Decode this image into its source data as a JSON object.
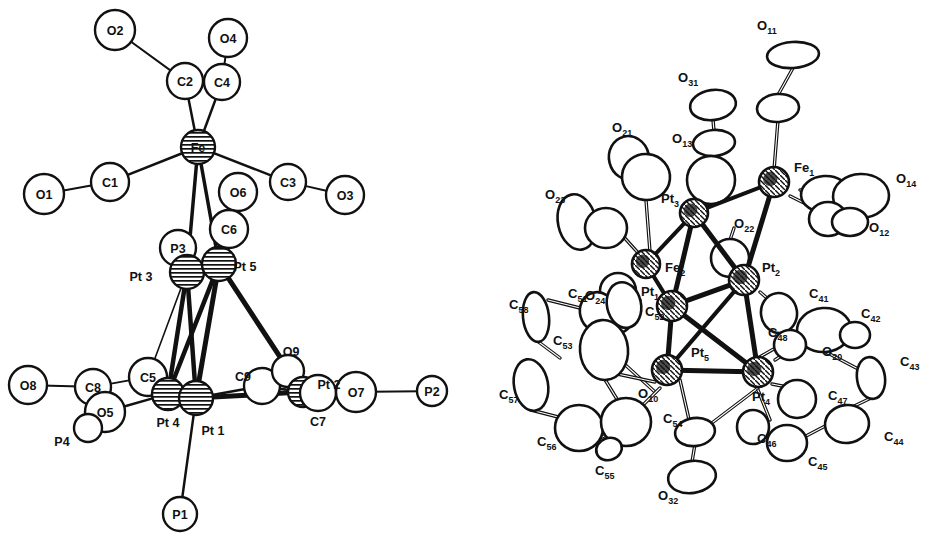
{
  "figure": {
    "kind": "crystal-structure-ortep-pair",
    "panels": [
      "left-core-skeleton",
      "right-full-thermal-ellipsoid"
    ]
  },
  "left": {
    "title": "",
    "style": "skeletal ball-and-stick, hatched metal atoms",
    "atoms": [
      {
        "id": "O2",
        "label": "O2",
        "x": 115,
        "y": 30,
        "r": 20,
        "kind": "circle",
        "fill": "white"
      },
      {
        "id": "O4",
        "label": "O4",
        "x": 228,
        "y": 38,
        "r": 19,
        "kind": "circle",
        "fill": "white"
      },
      {
        "id": "C2",
        "label": "C2",
        "x": 185,
        "y": 81,
        "r": 18,
        "kind": "circle",
        "fill": "white"
      },
      {
        "id": "C4",
        "label": "C4",
        "x": 222,
        "y": 82,
        "r": 18,
        "kind": "circle",
        "fill": "white"
      },
      {
        "id": "Fe",
        "label": "Fe",
        "x": 198,
        "y": 147,
        "r": 17,
        "kind": "hatched",
        "fill": "hatch"
      },
      {
        "id": "O1",
        "label": "O1",
        "x": 44,
        "y": 194,
        "r": 20,
        "kind": "circle",
        "fill": "white"
      },
      {
        "id": "C1",
        "label": "C1",
        "x": 110,
        "y": 182,
        "r": 19,
        "kind": "circle",
        "fill": "white"
      },
      {
        "id": "C3",
        "label": "C3",
        "x": 288,
        "y": 182,
        "r": 18,
        "kind": "circle",
        "fill": "white"
      },
      {
        "id": "O3",
        "label": "O3",
        "x": 345,
        "y": 195,
        "r": 19,
        "kind": "circle",
        "fill": "white"
      },
      {
        "id": "O6",
        "label": "O6",
        "x": 238,
        "y": 192,
        "r": 19,
        "kind": "circle",
        "fill": "white"
      },
      {
        "id": "C6",
        "label": "C6",
        "x": 229,
        "y": 229,
        "r": 19,
        "kind": "circle",
        "fill": "white"
      },
      {
        "id": "P3",
        "label": "P3",
        "x": 178,
        "y": 248,
        "r": 18,
        "kind": "circle",
        "fill": "white"
      },
      {
        "id": "Pt3",
        "label": "Pt 3",
        "x": 187,
        "y": 272,
        "r": 17,
        "kind": "hatched",
        "fill": "hatch",
        "label_dx": -46,
        "label_dy": 4
      },
      {
        "id": "Pt5",
        "label": "Pt 5",
        "x": 219,
        "y": 264,
        "r": 17,
        "kind": "hatched",
        "fill": "hatch",
        "label_dx": 26,
        "label_dy": 2
      },
      {
        "id": "C5",
        "label": "C5",
        "x": 148,
        "y": 377,
        "r": 19,
        "kind": "circle",
        "fill": "white"
      },
      {
        "id": "C8",
        "label": "C8",
        "x": 93,
        "y": 387,
        "r": 18,
        "kind": "circle",
        "fill": "white"
      },
      {
        "id": "O8",
        "label": "O8",
        "x": 28,
        "y": 385,
        "r": 19,
        "kind": "circle",
        "fill": "white"
      },
      {
        "id": "O5",
        "label": "O5",
        "x": 105,
        "y": 412,
        "r": 20,
        "kind": "circle",
        "fill": "white"
      },
      {
        "id": "P4",
        "label": "P4",
        "x": 88,
        "y": 428,
        "r": 14,
        "kind": "circle",
        "fill": "white",
        "label_dx": -26,
        "label_dy": 13
      },
      {
        "id": "Pt4",
        "label": "Pt 4",
        "x": 168,
        "y": 394,
        "r": 16,
        "kind": "hatched",
        "fill": "hatch",
        "label_dx": 0,
        "label_dy": 28
      },
      {
        "id": "Pt1",
        "label": "Pt 1",
        "x": 196,
        "y": 398,
        "r": 17,
        "kind": "hatched",
        "fill": "hatch",
        "label_dx": 17,
        "label_dy": 32
      },
      {
        "id": "C9",
        "label": "C9",
        "x": 262,
        "y": 386,
        "r": 18,
        "kind": "circle",
        "fill": "white",
        "label_dx": -19,
        "label_dy": -10
      },
      {
        "id": "O9",
        "label": "O9",
        "x": 288,
        "y": 371,
        "r": 16,
        "kind": "circle",
        "fill": "white",
        "label_dx": 3,
        "label_dy": -20
      },
      {
        "id": "Pt2",
        "label": "Pt 2",
        "x": 303,
        "y": 392,
        "r": 15,
        "kind": "hatched",
        "fill": "hatch",
        "label_dx": 26,
        "label_dy": -8
      },
      {
        "id": "C7",
        "label": "C7",
        "x": 318,
        "y": 393,
        "r": 18,
        "kind": "circle",
        "fill": "white",
        "label_dx": 0,
        "label_dy": 28
      },
      {
        "id": "O7",
        "label": "O7",
        "x": 356,
        "y": 392,
        "r": 20,
        "kind": "circle",
        "fill": "white"
      },
      {
        "id": "P2",
        "label": "P2",
        "x": 432,
        "y": 391,
        "r": 15,
        "kind": "circle",
        "fill": "white"
      },
      {
        "id": "P1",
        "label": "P1",
        "x": 180,
        "y": 514,
        "r": 17,
        "kind": "circle",
        "fill": "white"
      }
    ],
    "bonds": [
      {
        "a": "O2",
        "b": "C2",
        "w": 2
      },
      {
        "a": "O4",
        "b": "C4",
        "w": 2
      },
      {
        "a": "C2",
        "b": "Fe",
        "w": 2.5
      },
      {
        "a": "C4",
        "b": "Fe",
        "w": 2.5
      },
      {
        "a": "C1",
        "b": "O1",
        "w": 2
      },
      {
        "a": "C1",
        "b": "Fe",
        "w": 2.5
      },
      {
        "a": "C3",
        "b": "O3",
        "w": 2
      },
      {
        "a": "C3",
        "b": "Fe",
        "w": 2.5
      },
      {
        "a": "O6",
        "b": "C6",
        "w": 2
      },
      {
        "a": "C6",
        "b": "Pt5",
        "w": 2.5
      },
      {
        "a": "Fe",
        "b": "Pt3",
        "w": 3.5
      },
      {
        "a": "Fe",
        "b": "Pt5",
        "w": 3.5
      },
      {
        "a": "P3",
        "b": "Pt3",
        "w": 2.5
      },
      {
        "a": "Pt3",
        "b": "Pt5",
        "w": 5
      },
      {
        "a": "Pt3",
        "b": "Pt4",
        "w": 4.5
      },
      {
        "a": "Pt3",
        "b": "Pt1",
        "w": 4.5
      },
      {
        "a": "Pt3",
        "b": "C5",
        "w": 1.6
      },
      {
        "a": "Pt5",
        "b": "Pt1",
        "w": 5
      },
      {
        "a": "Pt5",
        "b": "Pt2",
        "w": 5
      },
      {
        "a": "Pt5",
        "b": "Pt4",
        "w": 4.5
      },
      {
        "a": "Pt4",
        "b": "Pt1",
        "w": 5
      },
      {
        "a": "Pt1",
        "b": "Pt2",
        "w": 5
      },
      {
        "a": "Pt4",
        "b": "C5",
        "w": 2.5
      },
      {
        "a": "C5",
        "b": "C8",
        "w": 1.8
      },
      {
        "a": "C8",
        "b": "O8",
        "w": 2
      },
      {
        "a": "C8",
        "b": "O5",
        "w": 2
      },
      {
        "a": "O5",
        "b": "P4",
        "w": 2
      },
      {
        "a": "O5",
        "b": "Pt4",
        "w": 2.5
      },
      {
        "a": "Pt1",
        "b": "C9",
        "w": 2.5
      },
      {
        "a": "C9",
        "b": "Pt2",
        "w": 2.5
      },
      {
        "a": "O9",
        "b": "Pt2",
        "w": 2
      },
      {
        "a": "Pt2",
        "b": "C7",
        "w": 2.5
      },
      {
        "a": "C7",
        "b": "O7",
        "w": 2
      },
      {
        "a": "O7",
        "b": "P2",
        "w": 2
      },
      {
        "a": "Pt1",
        "b": "P1",
        "w": 2.5
      }
    ]
  },
  "right": {
    "title": "",
    "style": "thermal ellipsoid (ORTEP) plot, open ellipsoids, shaded metal atoms",
    "labels": [
      {
        "text": "O",
        "sub": "11",
        "x": 757,
        "y": 30
      },
      {
        "text": "O",
        "sub": "31",
        "x": 678,
        "y": 82
      },
      {
        "text": "O",
        "sub": "21",
        "x": 612,
        "y": 132
      },
      {
        "text": "O",
        "sub": "13",
        "x": 672,
        "y": 143
      },
      {
        "text": "O",
        "sub": "23",
        "x": 545,
        "y": 199
      },
      {
        "text": "Fe",
        "sub": "1",
        "x": 794,
        "y": 172
      },
      {
        "text": "O",
        "sub": "14",
        "x": 896,
        "y": 183
      },
      {
        "text": "O",
        "sub": "12",
        "x": 869,
        "y": 232
      },
      {
        "text": "Pt",
        "sub": "3",
        "x": 661,
        "y": 203
      },
      {
        "text": "O",
        "sub": "22",
        "x": 734,
        "y": 228
      },
      {
        "text": "Fe",
        "sub": "2",
        "x": 665,
        "y": 272
      },
      {
        "text": "O",
        "sub": "24",
        "x": 585,
        "y": 300
      },
      {
        "text": "Pt",
        "sub": "1",
        "x": 641,
        "y": 296
      },
      {
        "text": "Pt",
        "sub": "2",
        "x": 762,
        "y": 272
      },
      {
        "text": "C",
        "sub": "51",
        "x": 568,
        "y": 298
      },
      {
        "text": "C",
        "sub": "58",
        "x": 509,
        "y": 309
      },
      {
        "text": "C",
        "sub": "52",
        "x": 645,
        "y": 316
      },
      {
        "text": "C",
        "sub": "53",
        "x": 553,
        "y": 345
      },
      {
        "text": "C",
        "sub": "41",
        "x": 809,
        "y": 298
      },
      {
        "text": "C",
        "sub": "42",
        "x": 861,
        "y": 318
      },
      {
        "text": "C",
        "sub": "48",
        "x": 768,
        "y": 337
      },
      {
        "text": "Pt",
        "sub": "5",
        "x": 691,
        "y": 357
      },
      {
        "text": "O",
        "sub": "20",
        "x": 822,
        "y": 356
      },
      {
        "text": "C",
        "sub": "43",
        "x": 900,
        "y": 366
      },
      {
        "text": "C",
        "sub": "57",
        "x": 499,
        "y": 399
      },
      {
        "text": "O",
        "sub": "10",
        "x": 638,
        "y": 398
      },
      {
        "text": "Pt",
        "sub": "4",
        "x": 752,
        "y": 401
      },
      {
        "text": "C",
        "sub": "47",
        "x": 828,
        "y": 400
      },
      {
        "text": "C",
        "sub": "54",
        "x": 663,
        "y": 423
      },
      {
        "text": "C",
        "sub": "56",
        "x": 537,
        "y": 446
      },
      {
        "text": "C",
        "sub": "46",
        "x": 757,
        "y": 443
      },
      {
        "text": "C",
        "sub": "44",
        "x": 884,
        "y": 441
      },
      {
        "text": "C",
        "sub": "55",
        "x": 595,
        "y": 475
      },
      {
        "text": "C",
        "sub": "45",
        "x": 808,
        "y": 466
      },
      {
        "text": "O",
        "sub": "32",
        "x": 658,
        "y": 500
      }
    ],
    "ellipsoids": [
      {
        "id": "O11",
        "cx": 793,
        "cy": 55,
        "rx": 26,
        "ry": 13,
        "rot": -4
      },
      {
        "id": "O11b",
        "cx": 778,
        "cy": 108,
        "rx": 21,
        "ry": 14,
        "rot": -4
      },
      {
        "id": "O31",
        "cx": 713,
        "cy": 105,
        "rx": 23,
        "ry": 15,
        "rot": -8
      },
      {
        "id": "O31b",
        "cx": 714,
        "cy": 143,
        "rx": 21,
        "ry": 13,
        "rot": -5
      },
      {
        "id": "O21",
        "cx": 629,
        "cy": 158,
        "rx": 20,
        "ry": 22,
        "rot": -14
      },
      {
        "id": "O21b",
        "cx": 646,
        "cy": 177,
        "rx": 24,
        "ry": 23,
        "rot": 6
      },
      {
        "id": "O13",
        "cx": 711,
        "cy": 180,
        "rx": 24,
        "ry": 24,
        "rot": 0
      },
      {
        "id": "O23",
        "cx": 577,
        "cy": 222,
        "rx": 19,
        "ry": 28,
        "rot": -12
      },
      {
        "id": "O23b",
        "cx": 606,
        "cy": 228,
        "rx": 21,
        "ry": 20,
        "rot": 0
      },
      {
        "id": "O14",
        "cx": 825,
        "cy": 194,
        "rx": 24,
        "ry": 18,
        "rot": -4
      },
      {
        "id": "O14b",
        "cx": 861,
        "cy": 196,
        "rx": 28,
        "ry": 22,
        "rot": -2
      },
      {
        "id": "O12",
        "cx": 828,
        "cy": 219,
        "rx": 19,
        "ry": 17,
        "rot": 0
      },
      {
        "id": "O12b",
        "cx": 850,
        "cy": 222,
        "rx": 18,
        "ry": 14,
        "rot": 0
      },
      {
        "id": "O22",
        "cx": 730,
        "cy": 258,
        "rx": 19,
        "ry": 19,
        "rot": 0
      },
      {
        "id": "O24",
        "cx": 618,
        "cy": 291,
        "rx": 18,
        "ry": 18,
        "rot": 0
      },
      {
        "id": "O24b",
        "cx": 614,
        "cy": 315,
        "rx": 20,
        "ry": 19,
        "rot": 0
      },
      {
        "id": "C51",
        "cx": 598,
        "cy": 312,
        "rx": 18,
        "ry": 20,
        "rot": -15
      },
      {
        "id": "C58",
        "cx": 536,
        "cy": 317,
        "rx": 13,
        "ry": 25,
        "rot": -6
      },
      {
        "id": "C57",
        "cx": 531,
        "cy": 385,
        "rx": 17,
        "ry": 26,
        "rot": -10
      },
      {
        "id": "C56",
        "cx": 579,
        "cy": 428,
        "rx": 24,
        "ry": 23,
        "rot": 0
      },
      {
        "id": "C53",
        "cx": 604,
        "cy": 350,
        "rx": 24,
        "ry": 30,
        "rot": -5
      },
      {
        "id": "C52",
        "cx": 624,
        "cy": 305,
        "rx": 17,
        "ry": 23,
        "rot": -12
      },
      {
        "id": "C54",
        "cx": 626,
        "cy": 422,
        "rx": 25,
        "ry": 24,
        "rot": 0
      },
      {
        "id": "C55",
        "cx": 609,
        "cy": 449,
        "rx": 13,
        "ry": 11,
        "rot": -20
      },
      {
        "id": "O10a",
        "cx": 695,
        "cy": 432,
        "rx": 20,
        "ry": 14,
        "rot": -8
      },
      {
        "id": "O32",
        "cx": 692,
        "cy": 477,
        "rx": 24,
        "ry": 16,
        "rot": -8
      },
      {
        "id": "C41",
        "cx": 779,
        "cy": 313,
        "rx": 18,
        "ry": 20,
        "rot": -8
      },
      {
        "id": "C42",
        "cx": 824,
        "cy": 330,
        "rx": 27,
        "ry": 22,
        "rot": -4
      },
      {
        "id": "C42b",
        "cx": 855,
        "cy": 335,
        "rx": 15,
        "ry": 13,
        "rot": 0
      },
      {
        "id": "C43",
        "cx": 871,
        "cy": 378,
        "rx": 14,
        "ry": 21,
        "rot": -8
      },
      {
        "id": "C44",
        "cx": 847,
        "cy": 424,
        "rx": 22,
        "ry": 19,
        "rot": -6
      },
      {
        "id": "C45",
        "cx": 787,
        "cy": 443,
        "rx": 20,
        "ry": 18,
        "rot": 0
      },
      {
        "id": "C46",
        "cx": 753,
        "cy": 427,
        "rx": 16,
        "ry": 17,
        "rot": 0
      },
      {
        "id": "C47",
        "cx": 797,
        "cy": 399,
        "rx": 19,
        "ry": 19,
        "rot": 0
      },
      {
        "id": "C48",
        "cx": 790,
        "cy": 345,
        "rx": 16,
        "ry": 15,
        "rot": 0
      }
    ],
    "metals": [
      {
        "id": "Fe1",
        "cx": 774,
        "cy": 182,
        "r": 15
      },
      {
        "id": "Fe2",
        "cx": 646,
        "cy": 264,
        "r": 14
      },
      {
        "id": "Pt3",
        "cx": 694,
        "cy": 213,
        "r": 14
      },
      {
        "id": "Pt1",
        "cx": 672,
        "cy": 306,
        "r": 15
      },
      {
        "id": "Pt2",
        "cx": 744,
        "cy": 280,
        "r": 15
      },
      {
        "id": "Pt5",
        "cx": 667,
        "cy": 370,
        "r": 15
      },
      {
        "id": "Pt4",
        "cx": 758,
        "cy": 372,
        "r": 15
      }
    ],
    "metal_bonds": [
      {
        "a": "Fe1",
        "b": "Pt3",
        "w": 4
      },
      {
        "a": "Fe1",
        "b": "Pt2",
        "w": 5
      },
      {
        "a": "Fe2",
        "b": "Pt3",
        "w": 4
      },
      {
        "a": "Fe2",
        "b": "Pt1",
        "w": 4
      },
      {
        "a": "Pt3",
        "b": "Pt1",
        "w": 5
      },
      {
        "a": "Pt3",
        "b": "Pt2",
        "w": 5
      },
      {
        "a": "Pt1",
        "b": "Pt2",
        "w": 5
      },
      {
        "a": "Pt1",
        "b": "Pt5",
        "w": 5
      },
      {
        "a": "Pt1",
        "b": "Pt4",
        "w": 5
      },
      {
        "a": "Pt2",
        "b": "Pt4",
        "w": 5
      },
      {
        "a": "Pt5",
        "b": "Pt4",
        "w": 5
      },
      {
        "a": "Pt2",
        "b": "Pt5",
        "w": 4
      }
    ]
  },
  "colors": {
    "ink": "#111111",
    "paper": "#ffffff"
  }
}
